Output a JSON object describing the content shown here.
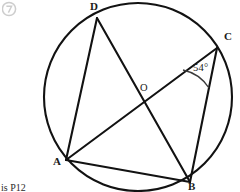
{
  "figure": {
    "stroke_color": "#121212",
    "background_color": "#ffffff",
    "circle": {
      "center_x": 138,
      "center_y": 97,
      "radius": 94,
      "center_label": "O",
      "center_label_x": 140,
      "center_label_y": 82
    },
    "vertices": [
      {
        "id": "D",
        "label": "D",
        "x": 97,
        "y": 18,
        "label_x": 90,
        "label_y": 0
      },
      {
        "id": "C",
        "label": "C",
        "x": 217,
        "y": 48,
        "label_x": 224,
        "label_y": 30
      },
      {
        "id": "B",
        "label": "B",
        "x": 190,
        "y": 182,
        "label_x": 188,
        "label_y": 180
      },
      {
        "id": "A",
        "label": "A",
        "x": 66,
        "y": 160,
        "label_x": 53,
        "label_y": 155
      }
    ],
    "chords": [
      {
        "name": "chord-DA",
        "from": "D",
        "to": "A"
      },
      {
        "name": "chord-AB",
        "from": "A",
        "to": "B"
      },
      {
        "name": "chord-BC",
        "from": "B",
        "to": "C"
      },
      {
        "name": "diagonal-DB",
        "from": "D",
        "to": "B"
      },
      {
        "name": "diagonal-AC",
        "from": "A",
        "to": "C"
      }
    ],
    "intersection": {
      "name": "O",
      "x": 140,
      "y": 96
    },
    "angle_marker": {
      "at_vertex": "C",
      "value": "54°",
      "degrees": 54,
      "label_x": 193,
      "label_y": 62,
      "arc_radius": 40
    }
  },
  "annotations": {
    "corner_mark": "circled-marker",
    "caption": "is  P12"
  }
}
